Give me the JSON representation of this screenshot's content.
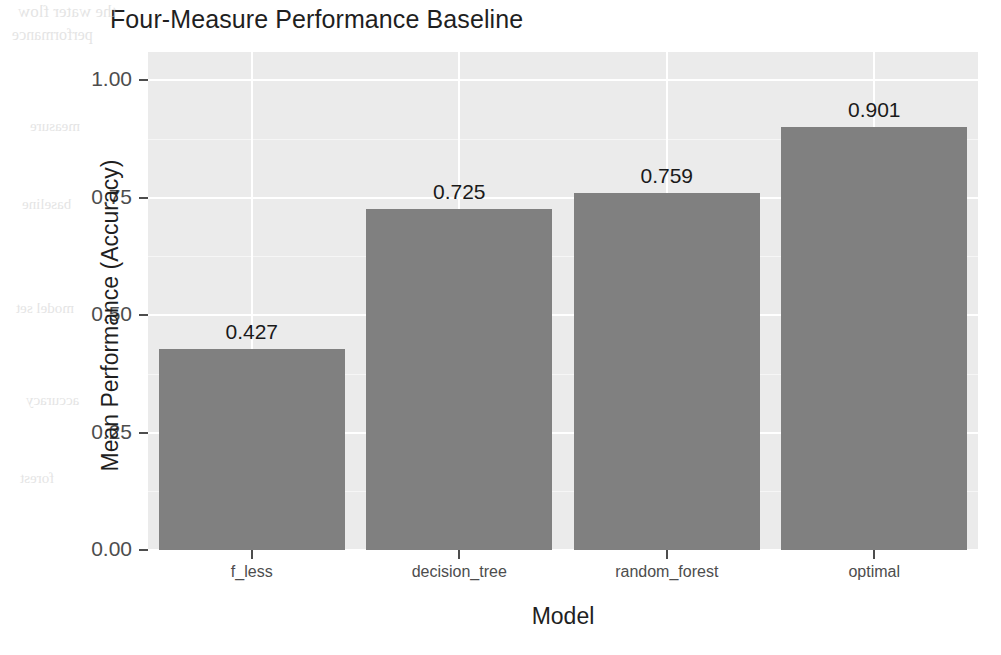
{
  "chart_data": {
    "type": "bar",
    "title": "Four-Measure Performance Baseline",
    "xlabel": "Model",
    "ylabel": "Mean Performance (Accuracy)",
    "categories": [
      "f_less",
      "decision_tree",
      "random_forest",
      "optimal"
    ],
    "values": [
      0.427,
      0.725,
      0.759,
      0.901
    ],
    "value_labels": [
      "0.427",
      "0.725",
      "0.759",
      "0.901"
    ],
    "ylim": [
      0.0,
      1.06
    ],
    "yticks": [
      0.0,
      0.25,
      0.5,
      0.75,
      1.0
    ],
    "ytick_labels": [
      "0.00",
      "0.25",
      "0.50",
      "0.75",
      "1.00"
    ],
    "grid": true,
    "legend": "none",
    "series": [
      {
        "name": "Mean Performance (Accuracy)",
        "values": [
          0.427,
          0.725,
          0.759,
          0.901
        ]
      }
    ],
    "colors": {
      "bar_fill": "#808080",
      "panel_background": "#ebebeb",
      "gridline": "#ffffff",
      "text": "#1a1a1a",
      "axis_text": "#4d4d4d",
      "figure_background": "#ffffff"
    }
  },
  "scan_artifacts": [
    {
      "text": "the water flow",
      "x": 18,
      "y": 2,
      "size": 17
    },
    {
      "text": "performance",
      "x": 12,
      "y": 26,
      "size": 16
    },
    {
      "text": "measure",
      "x": 30,
      "y": 118,
      "size": 15
    },
    {
      "text": "baseline",
      "x": 22,
      "y": 196,
      "size": 15
    },
    {
      "text": "model set",
      "x": 16,
      "y": 300,
      "size": 15
    },
    {
      "text": "accuracy",
      "x": 26,
      "y": 392,
      "size": 15
    },
    {
      "text": "forest",
      "x": 20,
      "y": 470,
      "size": 15
    }
  ]
}
